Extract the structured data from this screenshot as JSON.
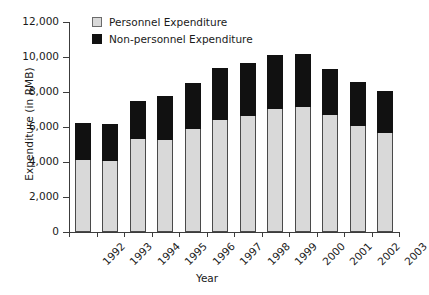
{
  "chart_data": {
    "type": "bar",
    "subtype": "stacked-vertical",
    "title": "",
    "xlabel": "Year",
    "ylabel": "Expenditure (in RMB)",
    "categories": [
      "1992",
      "1993",
      "1994",
      "1995",
      "1996",
      "1997",
      "1998",
      "1999",
      "2000",
      "2001",
      "2002",
      "2003"
    ],
    "series": [
      {
        "name": "Personnel Expenditure",
        "color": "#d9d9d9",
        "values": [
          4100,
          4080,
          5300,
          5280,
          5880,
          6380,
          6620,
          7050,
          7120,
          6660,
          6050,
          5650
        ]
      },
      {
        "name": "Non-personnel Expenditure",
        "color": "#111111",
        "values": [
          2150,
          2120,
          2200,
          2520,
          2650,
          2970,
          3050,
          3050,
          3060,
          2670,
          2530,
          2400
        ]
      }
    ],
    "totals": [
      6250,
      6200,
      7500,
      7800,
      8530,
      9350,
      9670,
      10100,
      10180,
      9330,
      8580,
      8050
    ],
    "ylim": [
      0,
      12000
    ],
    "yticks": [
      0,
      2000,
      4000,
      6000,
      8000,
      10000,
      12000
    ],
    "ytick_labels": [
      "0",
      "2,000",
      "4,000",
      "6,000",
      "8,000",
      "10,000",
      "12,000"
    ],
    "grid": false,
    "legend_position": "top-left-inside",
    "xtick_rotation": -45
  },
  "legend": {
    "items": [
      {
        "label": "Personnel Expenditure",
        "swatch": "light-gray-square"
      },
      {
        "label": "Non-personnel Expenditure",
        "swatch": "black-square"
      }
    ]
  }
}
